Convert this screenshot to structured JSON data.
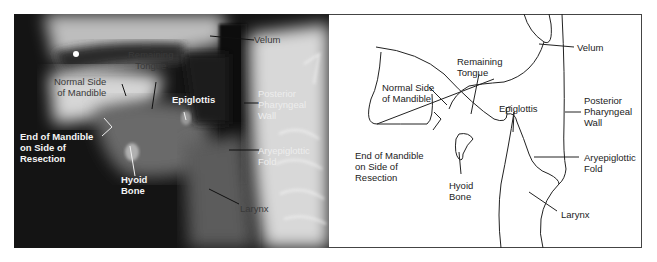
{
  "figure": {
    "left_panel": {
      "type": "radiograph",
      "labels": {
        "velum": "Velum",
        "remaining_tongue": "Remaining\nTongue",
        "normal_side_mandible": "Normal Side\nof Mandible",
        "epiglottis": "Epiglottis",
        "posterior_pharyngeal_wall": "Posterior\nPharyngeal\nWall",
        "end_of_mandible": "End of Mandible\non Side of\nResection",
        "aryepiglottic_fold": "Aryepiglottic\nFold",
        "hyoid_bone": "Hyoid\nBone",
        "larynx": "Larynx"
      }
    },
    "right_panel": {
      "type": "line-tracing",
      "labels": {
        "velum": "Velum",
        "remaining_tongue": "Remaining\nTongue",
        "normal_side_mandible": "Normal Side\nof Mandible",
        "epiglottis": "Epiglottis",
        "posterior_pharyngeal_wall": "Posterior\nPharyngeal\nWall",
        "end_of_mandible": "End of Mandible\non Side of\nResection",
        "aryepiglottic_fold": "Aryepiglottic\nFold",
        "hyoid_bone": "Hyoid\nBone",
        "larynx": "Larynx"
      }
    }
  }
}
